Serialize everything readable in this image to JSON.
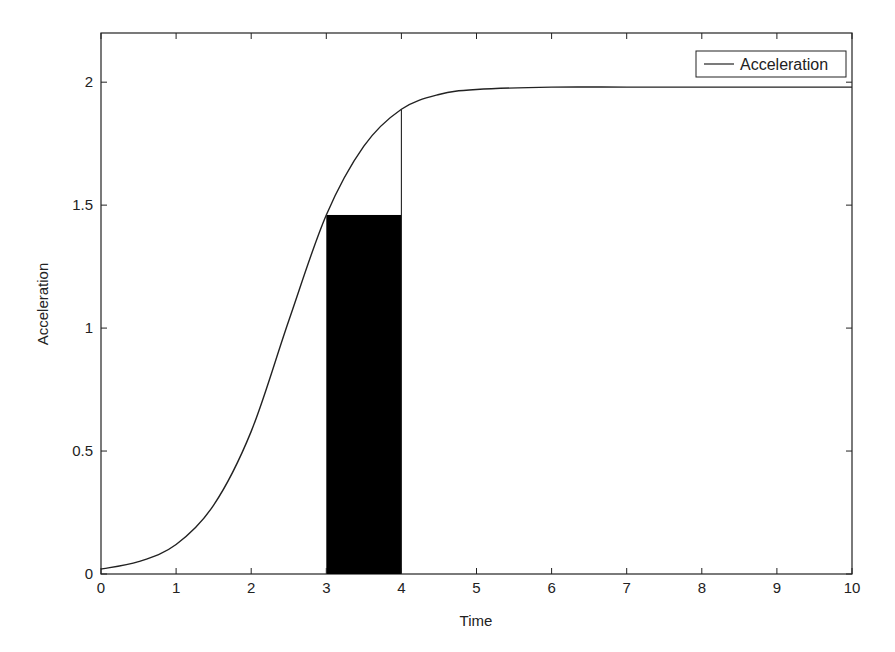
{
  "chart_data": {
    "type": "line",
    "title": "",
    "xlabel": "Time",
    "ylabel": "Acceleration",
    "xlim": [
      0,
      10
    ],
    "ylim": [
      0,
      2.2
    ],
    "grid": false,
    "legend_position": "upper right",
    "x_ticks": [
      0,
      1,
      2,
      3,
      4,
      5,
      6,
      7,
      8,
      9,
      10
    ],
    "x_tick_labels": [
      "0",
      "1",
      "2",
      "3",
      "4",
      "5",
      "6",
      "7",
      "8",
      "9",
      "10"
    ],
    "y_ticks": [
      0,
      0.5,
      1,
      1.5,
      2
    ],
    "y_tick_labels": [
      "0",
      "0.5",
      "1",
      "1.5",
      "2"
    ],
    "series": [
      {
        "name": "Acceleration",
        "color": "#222222",
        "x": [
          0,
          0.5,
          1,
          1.5,
          2,
          2.5,
          3,
          3.5,
          4,
          4.5,
          5,
          6,
          7,
          8,
          9,
          10
        ],
        "values": [
          0.02,
          0.05,
          0.12,
          0.28,
          0.58,
          1.03,
          1.46,
          1.74,
          1.89,
          1.95,
          1.97,
          1.98,
          1.98,
          1.98,
          1.98,
          1.98
        ]
      }
    ],
    "annotations": [
      {
        "type": "filled_rectangle",
        "x_from": 3,
        "x_to": 4,
        "y_from": 0,
        "y_to": 1.46,
        "color": "#000000"
      },
      {
        "type": "vertical_line",
        "x": 4,
        "y_from": 0,
        "y_to": 1.89,
        "color": "#222222"
      }
    ]
  },
  "legend": {
    "entries": [
      {
        "label": "Acceleration"
      }
    ]
  },
  "axes": {
    "xlabel": "Time",
    "ylabel": "Acceleration"
  }
}
